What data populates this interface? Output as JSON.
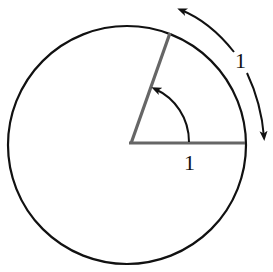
{
  "diagram": {
    "colors": {
      "circle": "#111111",
      "radii": "#666666",
      "arrows": "#111111",
      "background": "#ffffff"
    },
    "circle": {
      "cx": 127,
      "cy": 145,
      "r": 119
    },
    "radii": {
      "horizontal": {
        "x1": 130,
        "y1": 143,
        "x2": 245,
        "y2": 143
      },
      "angled": {
        "x1": 130,
        "y1": 143,
        "x2": 170,
        "y2": 33
      }
    },
    "labels": {
      "radius_label": "1",
      "arc_label": "1"
    },
    "elements": [
      {
        "name": "unit-circle",
        "description": "circle"
      },
      {
        "name": "horizontal-radius",
        "description": "radius of length 1"
      },
      {
        "name": "angled-radius",
        "description": "second radius"
      },
      {
        "name": "angle-arrow",
        "description": "curved arrow indicating the central angle"
      },
      {
        "name": "arc-length-arrows",
        "description": "double curved arrow indicating arc length 1"
      }
    ]
  }
}
